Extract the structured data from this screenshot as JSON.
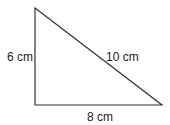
{
  "diagram": {
    "shape": "right triangle",
    "vertices": {
      "top": [
        35,
        8
      ],
      "bottom_left": [
        35,
        105
      ],
      "bottom_right": [
        162,
        105
      ]
    },
    "stroke_color": "#333333",
    "labels": {
      "left_side": "6 cm",
      "hypotenuse": "10 cm",
      "base": "8 cm"
    }
  }
}
